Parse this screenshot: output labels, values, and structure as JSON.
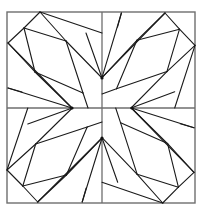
{
  "diagram": {
    "title": "",
    "type": "quilt-block-geometric-pattern",
    "center": [
      102,
      108
    ],
    "frame": {
      "x": 7,
      "y": 12,
      "width": 188,
      "height": 191
    },
    "colors": {
      "background": "#ffffff",
      "frame": "#6e6e6e",
      "lines": "#1a1a1a"
    },
    "hubs": [
      [
        102,
        78
      ],
      [
        132,
        108
      ],
      [
        102,
        138
      ],
      [
        72,
        108
      ]
    ],
    "quadrant_segments": [
      [
        40,
        12,
        24,
        28
      ],
      [
        24,
        28,
        8,
        43
      ],
      [
        40,
        12,
        66,
        41
      ],
      [
        66,
        41,
        102,
        78
      ],
      [
        40,
        12,
        102,
        33
      ],
      [
        24,
        28,
        66,
        41
      ],
      [
        24,
        28,
        35,
        72
      ],
      [
        8,
        43,
        35,
        72
      ],
      [
        35,
        72,
        72,
        108
      ],
      [
        8,
        43,
        72,
        108
      ],
      [
        66,
        41,
        83,
        93
      ],
      [
        35,
        72,
        83,
        93
      ],
      [
        83,
        93,
        88,
        108
      ],
      [
        8,
        88,
        72,
        108
      ],
      [
        8,
        88,
        22,
        92
      ],
      [
        86,
        33,
        102,
        78
      ]
    ],
    "rotations": [
      0,
      90,
      180,
      270
    ]
  }
}
